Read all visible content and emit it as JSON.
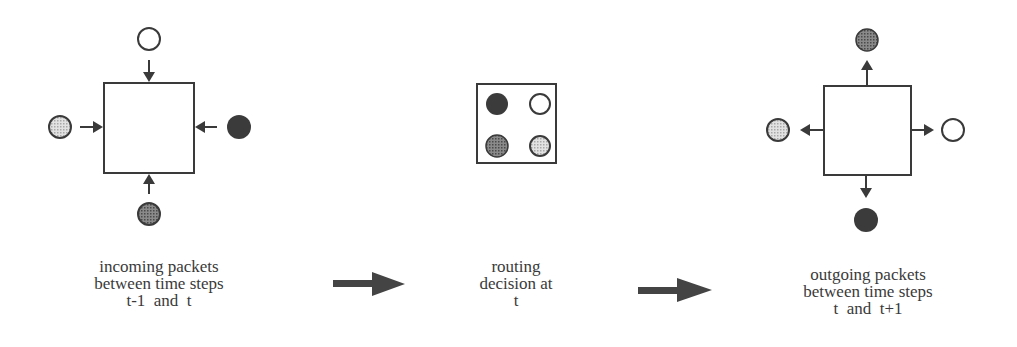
{
  "stages": [
    {
      "id": "incoming",
      "caption": [
        "incoming packets",
        "between time steps",
        "t-1  and  t"
      ],
      "packets": {
        "top": "white",
        "left": "light-dotted",
        "right": "black",
        "bottom": "dark-dotted"
      },
      "arrow_direction": "inward"
    },
    {
      "id": "routing",
      "caption": [
        "routing",
        "decision at",
        "t"
      ],
      "packets": {
        "top-left": "black",
        "top-right": "white",
        "bottom-left": "dark-dotted",
        "bottom-right": "light-dotted"
      }
    },
    {
      "id": "outgoing",
      "caption": [
        "outgoing packets",
        "between time steps",
        "t  and  t+1"
      ],
      "packets": {
        "top": "dark-dotted",
        "left": "light-dotted",
        "right": "white",
        "bottom": "black"
      },
      "arrow_direction": "outward"
    }
  ],
  "transitions": [
    {
      "from": "incoming",
      "to": "routing",
      "icon": "right-arrow-icon"
    },
    {
      "from": "routing",
      "to": "outgoing",
      "icon": "right-arrow-icon"
    }
  ],
  "colors": {
    "ink": "#3a3a3a",
    "black_packet": "#3b3b3b",
    "dark_dotted_packet": "#6f6f6f",
    "light_dotted_packet": "#c8c8c8",
    "white_packet": "#ffffff"
  }
}
